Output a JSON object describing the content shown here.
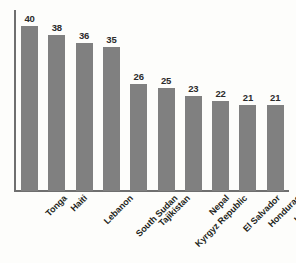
{
  "chart_data": {
    "type": "bar",
    "title": "",
    "subtitle": "",
    "xlabel": "",
    "ylabel": "",
    "categories": [
      "Tonga",
      "Haiti",
      "Lebanon",
      "South Sudan",
      "Tajikistan",
      "Kyrgyz Republic",
      "Nepal",
      "El Salvador",
      "Honduras",
      "Lesotho"
    ],
    "values": [
      40,
      38,
      36,
      35,
      26,
      25,
      23,
      22,
      21,
      21
    ],
    "value_labels": [
      "40",
      "38",
      "36",
      "35",
      "26",
      "25",
      "23",
      "22",
      "21",
      "21"
    ],
    "ylim": [
      0,
      44
    ],
    "grid": false,
    "legend": false,
    "legend_position": "none",
    "axis_ticks": {
      "y_tick_labels": [],
      "x_tick_labels": [
        "Tonga",
        "Haiti",
        "Lebanon",
        "South Sudan",
        "Tajikistan",
        "Kyrgyz Republic",
        "Nepal",
        "El Salvador",
        "Honduras",
        "Lesotho"
      ]
    },
    "x_tick_label_rotation_deg": -45,
    "colors": {
      "bar": "#808080",
      "axis": "#6f6f6f",
      "value_label": "#2b2b2b",
      "category_label": "#231f20",
      "background": "#fdfdfb"
    }
  }
}
